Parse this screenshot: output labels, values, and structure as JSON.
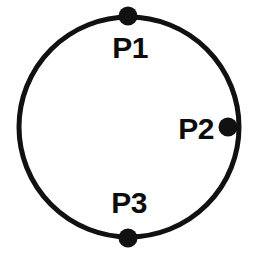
{
  "figure": {
    "type": "circle-diagram",
    "background_color": "#ffffff",
    "stroke_color": "#111111",
    "marker_color": "#111111",
    "label_color": "#0d0d0d",
    "width": 253,
    "height": 258,
    "circle": {
      "center_x": 129,
      "center_y": 127,
      "radius": 110,
      "stroke_width": 5,
      "fill": "none"
    },
    "markers": [
      {
        "id": "P1",
        "label": "P1",
        "position": "top",
        "cx": 128,
        "cy": 16,
        "r": 9.5,
        "label_x": 130,
        "label_y": 58,
        "label_anchor": "middle"
      },
      {
        "id": "P2",
        "label": "P2",
        "position": "right",
        "cx": 228,
        "cy": 127,
        "r": 9.5,
        "label_x": 214,
        "label_y": 139,
        "label_anchor": "end"
      },
      {
        "id": "P3",
        "label": "P3",
        "position": "bottom",
        "cx": 128,
        "cy": 238,
        "r": 9.5,
        "label_x": 129,
        "label_y": 213,
        "label_anchor": "middle"
      }
    ]
  }
}
